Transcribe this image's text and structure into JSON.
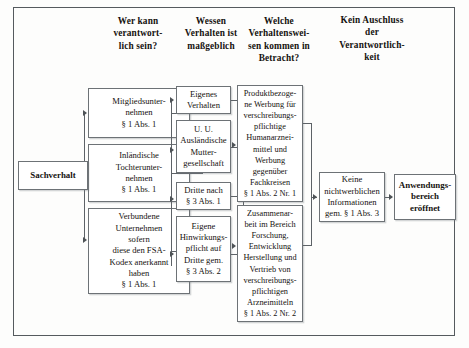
{
  "diagram": {
    "frame_color": "#555a5e",
    "box_border_color": "#6d7276",
    "line_color": "#5d6267",
    "headers": [
      {
        "id": "h1",
        "text": "Wer kann\nverantwort-\nlich sein?"
      },
      {
        "id": "h2",
        "text": "Wessen\nVerhalten ist\nmaßgeblich"
      },
      {
        "id": "h3",
        "text": "Welche\nVerhaltenswei-\nsen kommen in\nBetracht?"
      },
      {
        "id": "h4",
        "text": "Kein Auschluss\nder\nVerantwortlich-\nkeit"
      }
    ],
    "start_node": {
      "id": "n-start",
      "text": "Sachverhalt",
      "bold": true
    },
    "column1": [
      {
        "id": "n-mitglied",
        "text": "Mitgliedsunter-\nnehmen\n§ 1 Abs. 1"
      },
      {
        "id": "n-inlaend",
        "text": "Inländische\nTochterunter-\nnehmen\n§ 1 Abs. 1"
      },
      {
        "id": "n-verbunden",
        "text": "Verbundene\nUnternehmen\nsofern\ndiese den FSA-\nKodex anerkannt\nhaben\n§ 1 Abs. 1"
      }
    ],
    "column2": [
      {
        "id": "n-eigenes",
        "text": "Eigenes\nVerhalten"
      },
      {
        "id": "n-mutter",
        "text": "U. U.\nAusländische\nMutter-\ngesellschaft"
      },
      {
        "id": "n-dritte",
        "text": "Dritte nach\n§ 3 Abs. 1"
      },
      {
        "id": "n-hinwirk",
        "text": "Eigene\nHinwirkungs-\npflicht auf\nDritte gem.\n§ 3 Abs. 2"
      }
    ],
    "column3": [
      {
        "id": "n-werbung",
        "text": "Produktbezoge-\nne Werbung für\nverschreibungs-\npflichtige\nHumanarznei-\nmittel und\nWerbung\ngegenüber\nFachkreisen\n§ 1 Abs. 2 Nr. 1"
      },
      {
        "id": "n-zusammen",
        "text": "Zusammenar-\nbeit im Bereich\nForschung,\nEntwicklung\nHerstellung und\nVertrieb von\nverschreibungs-\npflichtigen\nArzneimitteln\n§ 1 Abs. 2 Nr. 2"
      }
    ],
    "column4": [
      {
        "id": "n-keine",
        "text": "Keine\nnichtwerblichen\nInformationen\ngem. § 1 Abs. 3"
      }
    ],
    "result_node": {
      "id": "n-result",
      "text": "Anwendungs-\nbereich\neröffnet",
      "bold": true
    }
  }
}
